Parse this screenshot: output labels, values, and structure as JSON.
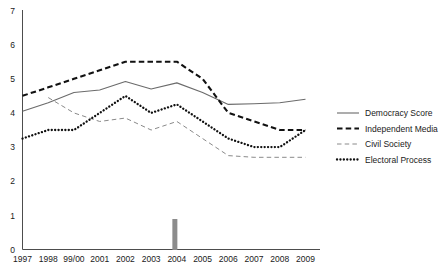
{
  "chart_data": {
    "type": "line",
    "title": "",
    "xlabel": "",
    "ylabel": "",
    "ylim": [
      0,
      7
    ],
    "yticks": [
      0,
      1,
      2,
      3,
      4,
      5,
      6,
      7
    ],
    "grid": false,
    "legend_position": "right",
    "categories": [
      "1997",
      "1998",
      "99/00",
      "2001",
      "2002",
      "2003",
      "2004",
      "2005",
      "2006",
      "2007",
      "2008",
      "2009"
    ],
    "series": [
      {
        "name": "Democracy Score",
        "style": "solid",
        "color": "#6b6b6b",
        "values": [
          4.05,
          4.3,
          4.6,
          4.67,
          4.92,
          4.7,
          4.88,
          4.6,
          4.25,
          4.27,
          4.3,
          4.4
        ]
      },
      {
        "name": "Independent Media",
        "style": "dashed",
        "color": "#111111",
        "values": [
          4.5,
          4.75,
          5.0,
          5.25,
          5.5,
          5.5,
          5.5,
          5.0,
          4.0,
          3.75,
          3.5,
          3.5
        ]
      },
      {
        "name": "Civil Society",
        "style": "thin-dashed",
        "color": "#8a8a8a",
        "values": [
          null,
          4.45,
          4.0,
          3.75,
          3.85,
          3.5,
          3.75,
          3.25,
          2.75,
          2.7,
          2.7,
          2.7
        ]
      },
      {
        "name": "Electoral Process",
        "style": "dotted",
        "color": "#111111",
        "values": [
          3.25,
          3.5,
          3.5,
          4.0,
          4.5,
          4.0,
          4.25,
          3.75,
          3.25,
          3.0,
          3.0,
          3.5
        ]
      }
    ],
    "annotations": [
      {
        "name": "event-marker",
        "label": "",
        "x_position": "2004",
        "color": "#8c8c8c"
      }
    ]
  },
  "legend": {
    "items": [
      {
        "label": "Democracy Score"
      },
      {
        "label": "Independent Media"
      },
      {
        "label": "Civil Society"
      },
      {
        "label": "Electoral Process"
      }
    ]
  },
  "axes": {
    "y_tick_labels": [
      "7",
      "6",
      "5",
      "4",
      "3",
      "2",
      "1",
      "0"
    ],
    "x_tick_labels": [
      "1997",
      "1998",
      "99/00",
      "2001",
      "2002",
      "2003",
      "2004",
      "2005",
      "2006",
      "2007",
      "2008",
      "2009"
    ]
  }
}
